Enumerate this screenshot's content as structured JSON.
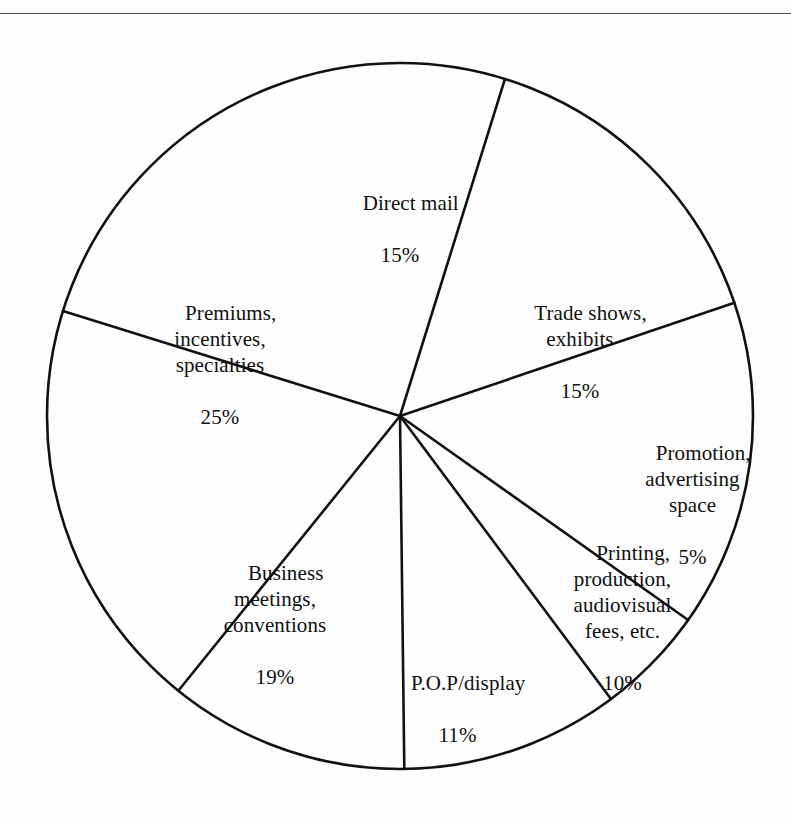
{
  "page": {
    "background_color": "#ffffff",
    "line_color": "#111111"
  },
  "chart_data": {
    "type": "pie",
    "title": "",
    "subtitle": "",
    "xlabel": "",
    "ylabel": "",
    "grid": false,
    "legend_position": "none",
    "labels_inside": true,
    "units": "percent",
    "total": 100,
    "center": {
      "x": 400,
      "y": 416
    },
    "radius": 353,
    "start_angle_deg_from_12oclock": 17.3,
    "direction": "clockwise",
    "categories": [
      "Direct mail",
      "Trade shows, exhibits",
      "Promotion, advertising space",
      "Printing, production, audiovisual fees, etc.",
      "P.O.P/display",
      "Business meetings, conventions",
      "Premiums, incentives, specialties"
    ],
    "values": [
      15,
      15,
      5,
      10,
      11,
      19,
      25
    ],
    "slices": [
      {
        "name": "direct-mail",
        "lines": [
          "Direct mail"
        ],
        "value": 15,
        "percent_label": "15%",
        "start_deg": 17.3,
        "end_deg": 71.3
      },
      {
        "name": "trade-shows",
        "lines": [
          "Trade shows,",
          "exhibits"
        ],
        "value": 15,
        "percent_label": "15%",
        "start_deg": 71.3,
        "end_deg": 125.3
      },
      {
        "name": "promotion-advertising-space",
        "lines": [
          "Promotion,",
          "advertising",
          "space"
        ],
        "value": 5,
        "percent_label": "5%",
        "start_deg": 125.3,
        "end_deg": 143.3
      },
      {
        "name": "printing-production",
        "lines": [
          "Printing,",
          "production,",
          "audiovisual",
          "fees, etc."
        ],
        "value": 10,
        "percent_label": "10%",
        "start_deg": 143.3,
        "end_deg": 179.3
      },
      {
        "name": "pop-display",
        "lines": [
          "P.O.P/display"
        ],
        "value": 11,
        "percent_label": "11%",
        "start_deg": 179.3,
        "end_deg": 218.9
      },
      {
        "name": "business-meetings",
        "lines": [
          "Business",
          "meetings,",
          "conventions"
        ],
        "value": 19,
        "percent_label": "19%",
        "start_deg": 218.9,
        "end_deg": 287.3
      },
      {
        "name": "premiums-incentives",
        "lines": [
          "Premiums,",
          "incentives,",
          "specialties"
        ],
        "value": 25,
        "percent_label": "25%",
        "start_deg": 287.3,
        "end_deg": 377.3
      }
    ]
  },
  "labels": {
    "direct_mail": {
      "text": "Direct mail",
      "percent": "15%"
    },
    "trade_shows": {
      "text": "Trade shows,\nexhibits",
      "percent": "15%"
    },
    "promotion": {
      "text": "Promotion,\nadvertising\nspace",
      "percent": "5%"
    },
    "printing": {
      "text": "Printing,\nproduction,\naudiovisual\nfees, etc.",
      "percent": "10%"
    },
    "pop_display": {
      "text": "P.O.P/display",
      "percent": "11%"
    },
    "business_meetings": {
      "text": "Business\nmeetings,\nconventions",
      "percent": "19%"
    },
    "premiums": {
      "text": "Premiums,\nincentives,\nspecialties",
      "percent": "25%"
    }
  }
}
